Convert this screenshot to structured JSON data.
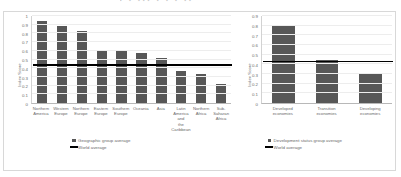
{
  "chart_data": [
    {
      "type": "bar",
      "panel": "left",
      "title": "",
      "xlabel": "",
      "ylabel": "Index Score",
      "ylim": [
        0,
        1
      ],
      "yticks": [
        "0",
        "0.1",
        "0.2",
        "0.3",
        "0.4",
        "0.5",
        "0.6",
        "0.7",
        "0.8",
        "0.9",
        "1"
      ],
      "grid": true,
      "legend_position": "bottom",
      "categories": [
        "Northern America",
        "Western Europe",
        "Northern Europe",
        "Eastern Europe",
        "Southern Europe",
        "Oceania",
        "Asia",
        "Latin America and the Caribbean",
        "Northern Africa",
        "Sub-Saharan Africa"
      ],
      "values": [
        0.94,
        0.89,
        0.83,
        0.61,
        0.6,
        0.57,
        0.52,
        0.37,
        0.33,
        0.22
      ],
      "reference_line": {
        "label": "World average",
        "value": 0.44
      },
      "legend": [
        {
          "label": "Geographic group average",
          "marker": "square",
          "color": "#575757"
        },
        {
          "label": "World average",
          "marker": "line",
          "color": "#000000"
        }
      ]
    },
    {
      "type": "bar",
      "panel": "right",
      "title": "",
      "xlabel": "",
      "ylabel": "Index Score",
      "ylim": [
        0,
        0.9
      ],
      "yticks": [
        "0",
        "0.1",
        "0.2",
        "0.3",
        "0.4",
        "0.5",
        "0.6",
        "0.7",
        "0.8",
        "0.9"
      ],
      "grid": true,
      "legend_position": "bottom",
      "categories": [
        "Developed economies",
        "Transition economies",
        "Developing economies"
      ],
      "values": [
        0.8,
        0.44,
        0.31
      ],
      "reference_line": {
        "label": "World average",
        "value": 0.43
      },
      "legend": [
        {
          "label": "Development status group average",
          "marker": "square",
          "color": "#575757"
        },
        {
          "label": "World average",
          "marker": "line",
          "color": "#000000"
        }
      ]
    }
  ],
  "colors": {
    "bar": "#575757",
    "reference_line": "#000000",
    "grid": "#ededed",
    "axis": "#b8b8b8",
    "tick_text": "#6a6a6a",
    "border": "#d8d8d8",
    "background": "#ffffff"
  }
}
